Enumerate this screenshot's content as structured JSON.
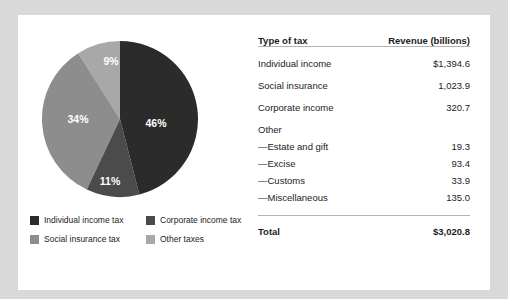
{
  "card": {
    "background": "#ffffff",
    "page_background": "#d9d9d9"
  },
  "chart_data": {
    "type": "pie",
    "title": "",
    "categories": [
      "Individual income tax",
      "Social insurance tax",
      "Other taxes",
      "Corporate income tax"
    ],
    "values": [
      46,
      34,
      9,
      11
    ],
    "value_labels": [
      "46%",
      "34%",
      "9%",
      "11%"
    ],
    "colors": [
      "#2b2b2b",
      "#8d8d8d",
      "#a8a8a8",
      "#4b4b4b"
    ],
    "legend_position": "bottom",
    "grid": false,
    "units": "percent of total revenue"
  },
  "pie": {
    "labels": [
      {
        "text": "46%",
        "x": 116,
        "y": 88
      },
      {
        "text": "34%",
        "x": 38,
        "y": 84
      },
      {
        "text": "9%",
        "x": 71,
        "y": 24
      },
      {
        "text": "11%",
        "x": 70,
        "y": 146
      }
    ]
  },
  "legend": {
    "items": [
      {
        "label": "Individual income tax",
        "color": "#2b2b2b"
      },
      {
        "label": "Corporate income tax",
        "color": "#4b4b4b"
      },
      {
        "label": "Social insurance tax",
        "color": "#8d8d8d"
      },
      {
        "label": "Other taxes",
        "color": "#a8a8a8"
      }
    ]
  },
  "table": {
    "headers": {
      "type": "Type of tax",
      "revenue": "Revenue (billions)"
    },
    "rows": [
      {
        "label": "Individual income",
        "value": "$1,394.6",
        "kind": "data"
      },
      {
        "label": "Social insurance",
        "value": "1,023.9",
        "kind": "data"
      },
      {
        "label": "Corporate income",
        "value": "320.7",
        "kind": "data"
      },
      {
        "label": "Other",
        "value": "",
        "kind": "group"
      },
      {
        "label": "—Estate and gift",
        "value": "19.3",
        "kind": "sub"
      },
      {
        "label": "—Excise",
        "value": "93.4",
        "kind": "sub"
      },
      {
        "label": "—Customs",
        "value": "33.9",
        "kind": "sub"
      },
      {
        "label": "—Miscellaneous",
        "value": "135.0",
        "kind": "sub"
      }
    ],
    "total": {
      "label": "Total",
      "value": "$3,020.8"
    }
  }
}
